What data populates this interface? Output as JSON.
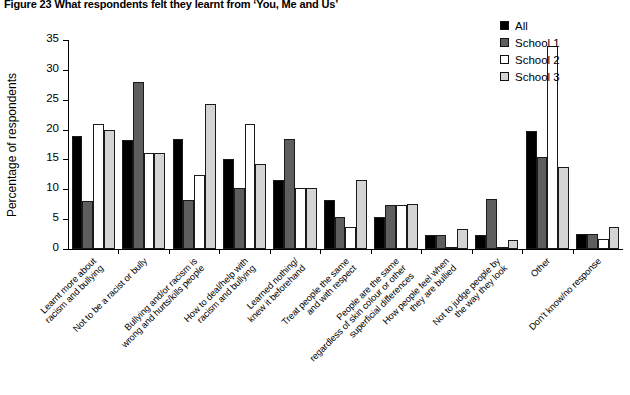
{
  "figure": {
    "title": "Figure 23  What respondents felt they learnt from ‘You, Me and Us’"
  },
  "legend": {
    "position": "top-right",
    "items": [
      {
        "label": "All",
        "color": "#000000"
      },
      {
        "label": "School 1",
        "color": "#5e5e5e"
      },
      {
        "label": "School 2",
        "color": "#ffffff"
      },
      {
        "label": "School 3",
        "color": "#d4d4d4"
      }
    ]
  },
  "axes": {
    "y_title": "Percentage of respondents",
    "y_ticks": [
      "0",
      "5",
      "10",
      "15",
      "20",
      "25",
      "30",
      "35"
    ]
  },
  "chart_data": {
    "type": "bar",
    "title": "Figure 23  What respondents felt they learnt from ‘You, Me and Us’",
    "xlabel": "",
    "ylabel": "Percentage of respondents",
    "ylim": [
      0,
      35
    ],
    "ytick_step": 5,
    "grid": false,
    "legend_position": "top-right",
    "categories": [
      "Learnt more about racism and bullying",
      "Not to be a racist or bully",
      "Bullying and/or racism is wrong and hurts/kills people",
      "How to deal/help with racism and bullying",
      "Learned nothing/ knew it beforehand",
      "Treat people the same and with respect",
      "People are the same regardless of skin colour or other superficial differences",
      "How people feel when they are bullied",
      "Not to judge people by the way they look",
      "Other",
      "Don’t know/no response"
    ],
    "series": [
      {
        "name": "All",
        "color": "#000000",
        "values": [
          19.0,
          18.2,
          18.4,
          15.0,
          11.5,
          8.2,
          5.4,
          2.3,
          2.3,
          19.8,
          2.5
        ]
      },
      {
        "name": "School 1",
        "color": "#5e5e5e",
        "values": [
          8.0,
          28.0,
          8.2,
          10.2,
          18.5,
          5.3,
          7.4,
          2.3,
          8.4,
          15.4,
          2.5
        ]
      },
      {
        "name": "School 2",
        "color": "#ffffff",
        "values": [
          21.0,
          16.0,
          12.4,
          21.0,
          10.2,
          3.7,
          7.4,
          0.0,
          0.0,
          34.0,
          1.7
        ]
      },
      {
        "name": "School 3",
        "color": "#d4d4d4",
        "values": [
          20.0,
          16.0,
          24.3,
          14.2,
          10.3,
          11.6,
          7.6,
          3.4,
          1.5,
          13.8,
          3.7
        ]
      }
    ]
  }
}
